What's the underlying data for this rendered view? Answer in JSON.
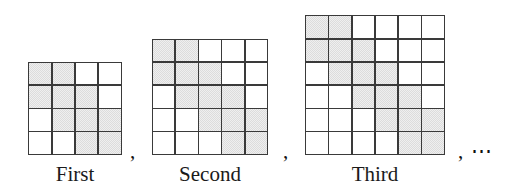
{
  "figure": {
    "kind": "sequence-of-shaded-grids",
    "separators": [
      ",",
      ",",
      ", ⋯"
    ],
    "terms": [
      {
        "label": "First",
        "ordinal": 1,
        "rows": 4,
        "cols": 4,
        "shaded_count": 10,
        "pattern": [
          [
            1,
            1,
            0,
            0
          ],
          [
            1,
            1,
            1,
            0
          ],
          [
            0,
            1,
            1,
            1
          ],
          [
            0,
            0,
            1,
            1
          ]
        ]
      },
      {
        "label": "Second",
        "ordinal": 2,
        "rows": 5,
        "cols": 5,
        "shaded_count": 13,
        "pattern": [
          [
            1,
            1,
            0,
            0,
            0
          ],
          [
            1,
            1,
            1,
            0,
            0
          ],
          [
            0,
            1,
            1,
            1,
            0
          ],
          [
            0,
            0,
            1,
            1,
            1
          ],
          [
            0,
            0,
            0,
            1,
            1
          ]
        ]
      },
      {
        "label": "Third",
        "ordinal": 3,
        "rows": 6,
        "cols": 6,
        "shaded_count": 16,
        "pattern": [
          [
            1,
            1,
            0,
            0,
            0,
            0
          ],
          [
            1,
            1,
            1,
            0,
            0,
            0
          ],
          [
            0,
            1,
            1,
            1,
            0,
            0
          ],
          [
            0,
            0,
            1,
            1,
            1,
            0
          ],
          [
            0,
            0,
            0,
            1,
            1,
            1
          ],
          [
            0,
            0,
            0,
            0,
            1,
            1
          ]
        ]
      }
    ],
    "colors": {
      "shaded_cell": "#dcdcdc",
      "empty_cell": "#ffffff",
      "grid_line": "#3a3a3a",
      "text": "#1a1a1a",
      "background": "#ffffff"
    },
    "geometry": {
      "cell_px": 23,
      "term_centers_x": [
        75,
        210,
        375
      ],
      "separator_x": [
        130,
        283,
        458
      ],
      "grids_bottom_y": 150
    }
  }
}
